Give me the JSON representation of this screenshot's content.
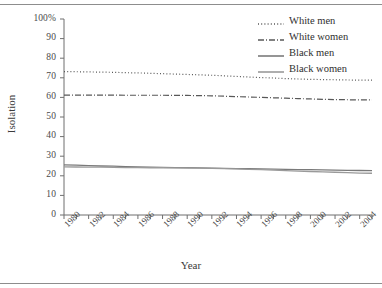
{
  "figure": {
    "background_color": "#ffffff",
    "rule_color": "#8d8d8d"
  },
  "chart_data": {
    "type": "line",
    "title": "",
    "xlabel": "Year",
    "ylabel": "Isolation",
    "xlim": [
      1980,
      2005
    ],
    "ylim": [
      0,
      100
    ],
    "grid": false,
    "legend_position": "top-right",
    "y_ticks": [
      "100%",
      "90",
      "80",
      "70",
      "60",
      "50",
      "40",
      "30",
      "20",
      "10",
      "0"
    ],
    "y_tick_values": [
      100,
      90,
      80,
      70,
      60,
      50,
      40,
      30,
      20,
      10,
      0
    ],
    "x_tick_labels": [
      "1980",
      "1982",
      "1984",
      "1986",
      "1988",
      "1990",
      "1992",
      "1994",
      "1996",
      "1998",
      "2000",
      "2002",
      "2004"
    ],
    "x_tick_values": [
      1980,
      1982,
      1984,
      1986,
      1988,
      1990,
      1992,
      1994,
      1996,
      1998,
      2000,
      2002,
      2004
    ],
    "x_minor_ticks": [
      1980,
      1981,
      1982,
      1983,
      1984,
      1985,
      1986,
      1987,
      1988,
      1989,
      1990,
      1991,
      1992,
      1993,
      1994,
      1995,
      1996,
      1997,
      1998,
      1999,
      2000,
      2001,
      2002,
      2003,
      2004,
      2005
    ],
    "x": [
      1980,
      1981,
      1982,
      1983,
      1984,
      1985,
      1986,
      1987,
      1988,
      1989,
      1990,
      1991,
      1992,
      1993,
      1994,
      1995,
      1996,
      1997,
      1998,
      1999,
      2000,
      2001,
      2002,
      2003,
      2004,
      2005
    ],
    "series": [
      {
        "name": "White men",
        "style": "dotted",
        "color": "#585858",
        "values": [
          73.2,
          73.1,
          73.0,
          72.9,
          72.8,
          72.6,
          72.5,
          72.3,
          72.1,
          71.9,
          71.7,
          71.5,
          71.3,
          71.0,
          70.7,
          70.4,
          70.1,
          69.9,
          69.6,
          69.4,
          69.2,
          69.1,
          69.0,
          68.9,
          68.8,
          68.8
        ]
      },
      {
        "name": "White women",
        "style": "dash-dot",
        "color": "#585858",
        "values": [
          61.2,
          61.2,
          61.2,
          61.2,
          61.2,
          61.1,
          61.1,
          61.1,
          61.1,
          61.0,
          61.0,
          60.9,
          60.8,
          60.6,
          60.4,
          60.2,
          60.0,
          59.8,
          59.6,
          59.4,
          59.2,
          59.0,
          58.9,
          58.8,
          58.7,
          58.7
        ]
      },
      {
        "name": "Black men",
        "style": "solid",
        "color": "#7a7a7a",
        "values": [
          25.6,
          25.4,
          25.2,
          25.0,
          24.9,
          24.7,
          24.6,
          24.4,
          24.3,
          24.2,
          24.1,
          24.0,
          23.9,
          23.8,
          23.7,
          23.6,
          23.5,
          23.4,
          23.3,
          23.2,
          23.1,
          23.0,
          22.9,
          22.8,
          22.7,
          22.6
        ]
      },
      {
        "name": "Black women",
        "style": "solid",
        "color": "#9a9a9a",
        "values": [
          24.6,
          24.5,
          24.4,
          24.4,
          24.3,
          24.2,
          24.2,
          24.1,
          24.1,
          24.0,
          24.0,
          23.9,
          23.8,
          23.7,
          23.5,
          23.3,
          23.1,
          22.9,
          22.6,
          22.4,
          22.2,
          22.0,
          21.8,
          21.6,
          21.4,
          21.3
        ]
      }
    ]
  }
}
